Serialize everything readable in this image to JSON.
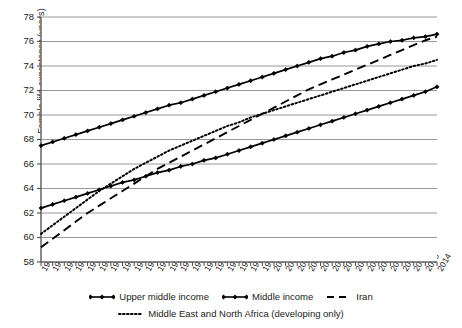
{
  "chart_data": {
    "type": "line",
    "title": "",
    "xlabel": "",
    "ylabel": "Female life expectancy (years)",
    "ylim": [
      58,
      78
    ],
    "ytick_step": 2,
    "yticks": [
      58,
      60,
      62,
      64,
      66,
      68,
      70,
      72,
      74,
      76,
      78
    ],
    "grid": "horizontal",
    "legend_position": "bottom",
    "x": [
      1980,
      1981,
      1982,
      1983,
      1984,
      1985,
      1986,
      1987,
      1988,
      1989,
      1990,
      1991,
      1992,
      1993,
      1994,
      1995,
      1996,
      1997,
      1998,
      1999,
      2000,
      2001,
      2002,
      2003,
      2004,
      2005,
      2006,
      2007,
      2008,
      2009,
      2010,
      2011,
      2012,
      2013,
      2014
    ],
    "xtick_labels": [
      "1980",
      "1981",
      "1982",
      "1983",
      "1984",
      "1985",
      "1986",
      "1987",
      "1988",
      "1989",
      "1990",
      "1991",
      "1992",
      "1993",
      "1994",
      "1995",
      "1996",
      "1997",
      "1998",
      "1999",
      "2000",
      "2001",
      "2002",
      "2003",
      "2004",
      "2005",
      "2006",
      "2007",
      "2008",
      "2009",
      "2010",
      "2011",
      "2012",
      "2013",
      "2014"
    ],
    "series": [
      {
        "name": "Upper middle income",
        "style": "solid-diamond",
        "color": "#000000",
        "values": [
          67.5,
          67.8,
          68.1,
          68.4,
          68.7,
          69.0,
          69.3,
          69.6,
          69.9,
          70.2,
          70.5,
          70.8,
          71.0,
          71.3,
          71.6,
          71.9,
          72.2,
          72.5,
          72.8,
          73.1,
          73.4,
          73.7,
          74.0,
          74.3,
          74.6,
          74.8,
          75.1,
          75.3,
          75.6,
          75.8,
          76.0,
          76.1,
          76.3,
          76.4,
          76.6
        ]
      },
      {
        "name": "Middle income",
        "style": "solid-diamond",
        "color": "#000000",
        "values": [
          62.4,
          62.7,
          63.0,
          63.3,
          63.6,
          63.9,
          64.2,
          64.5,
          64.7,
          65.0,
          65.3,
          65.5,
          65.8,
          66.0,
          66.3,
          66.5,
          66.8,
          67.1,
          67.4,
          67.7,
          68.0,
          68.3,
          68.6,
          68.9,
          69.2,
          69.5,
          69.8,
          70.1,
          70.4,
          70.7,
          71.0,
          71.3,
          71.6,
          71.9,
          72.3
        ]
      },
      {
        "name": "Iran",
        "style": "dashed",
        "color": "#000000",
        "values": [
          59.2,
          59.9,
          60.6,
          61.3,
          62.0,
          62.6,
          63.2,
          63.8,
          64.4,
          65.0,
          65.6,
          66.1,
          66.6,
          67.1,
          67.6,
          68.1,
          68.6,
          69.1,
          69.6,
          70.1,
          70.6,
          71.1,
          71.6,
          72.1,
          72.5,
          72.9,
          73.3,
          73.7,
          74.1,
          74.5,
          74.9,
          75.3,
          75.7,
          76.1,
          76.4
        ]
      },
      {
        "name": "Middle East and North Africa (developing only)",
        "style": "dotted",
        "color": "#000000",
        "values": [
          60.3,
          61.0,
          61.7,
          62.4,
          63.1,
          63.8,
          64.4,
          65.0,
          65.6,
          66.1,
          66.6,
          67.1,
          67.5,
          67.9,
          68.3,
          68.7,
          69.1,
          69.4,
          69.8,
          70.1,
          70.4,
          70.7,
          71.0,
          71.3,
          71.6,
          71.9,
          72.2,
          72.5,
          72.8,
          73.1,
          73.4,
          73.7,
          74.0,
          74.2,
          74.5
        ]
      }
    ]
  },
  "axis": {
    "ylabel": "Female life expectancy (years)"
  },
  "legend": {
    "row1": [
      {
        "label": "Upper middle income",
        "key": "solid-diamond"
      },
      {
        "label": "Middle income",
        "key": "solid-diamond"
      },
      {
        "label": "Iran",
        "key": "dashed"
      }
    ],
    "row2": [
      {
        "label": "Middle East and North Africa (developing only)",
        "key": "dotted"
      }
    ]
  }
}
